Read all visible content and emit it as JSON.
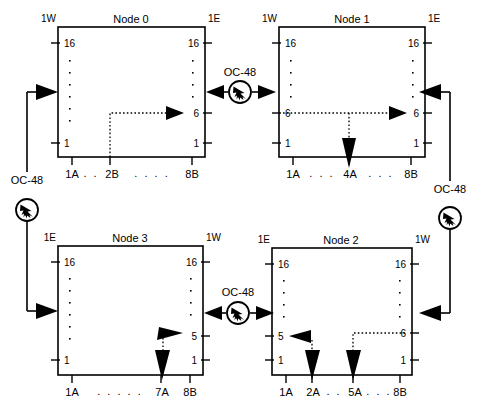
{
  "diagram": {
    "link_label": "OC-48",
    "colors": {
      "line": "#000000",
      "background": "#ffffff"
    },
    "nodes": [
      {
        "id": "node0",
        "title": "Node 0",
        "left_side_label": "1W",
        "right_side_label": "1E",
        "left_port_top": "16",
        "left_port_bottom": "1",
        "right_port_top": "16",
        "right_port_bottom": "1",
        "right_port_mid": "6",
        "slot_labels": [
          "1A",
          "2B",
          "8B"
        ],
        "slot_dots_left": ". .",
        "slot_dots_right": ". . . .",
        "paths": [
          {
            "from": "2B",
            "to": "right port 6",
            "style": "dotted",
            "arrow": "right"
          }
        ]
      },
      {
        "id": "node1",
        "title": "Node 1",
        "left_side_label": "1W",
        "right_side_label": "1E",
        "left_port_top": "16",
        "left_port_bottom": "1",
        "left_port_mid": "6",
        "right_port_top": "16",
        "right_port_bottom": "1",
        "right_port_mid": "6",
        "slot_labels": [
          "1A",
          "4A",
          "8B"
        ],
        "slot_dots_left": ". . .",
        "slot_dots_right": ". . .",
        "paths": [
          {
            "from": "left port 6",
            "to": "right port 6",
            "style": "dotted",
            "arrow": "right"
          },
          {
            "from": "left port 6",
            "to": "4A",
            "style": "dotted",
            "arrow": "down"
          }
        ]
      },
      {
        "id": "node2",
        "title": "Node 2",
        "left_side_label": "1E",
        "right_side_label": "1W",
        "left_port_top": "16",
        "left_port_bottom": "1",
        "left_port_mid": "5",
        "right_port_top": "16",
        "right_port_bottom": "1",
        "right_port_mid": "6",
        "slot_labels": [
          "1A",
          "2A",
          "5A",
          "8B"
        ],
        "slot_dots_mid": ". .",
        "slot_dots_right": ". . .",
        "paths": [
          {
            "from": "left port 5",
            "to": "2A",
            "style": "dotted",
            "arrow": "down-and-left"
          },
          {
            "from": "right port 6",
            "to": "5A",
            "style": "dotted",
            "arrow": "down"
          }
        ]
      },
      {
        "id": "node3",
        "title": "Node 3",
        "left_side_label": "1E",
        "right_side_label": "1W",
        "left_port_top": "16",
        "left_port_bottom": "1",
        "right_port_top": "16",
        "right_port_bottom": "1",
        "right_port_mid": "5",
        "slot_labels": [
          "1A",
          "7A",
          "8B"
        ],
        "slot_dots_mid": ". . . . .",
        "paths": [
          {
            "from": "right port 5",
            "to": "7A",
            "style": "dotted",
            "arrow": "down"
          }
        ]
      }
    ],
    "links": [
      {
        "id": "link-top",
        "label": "OC-48",
        "between": [
          "node0 1E",
          "node1 1W"
        ],
        "icon": "oc48-amplifier-icon"
      },
      {
        "id": "link-left",
        "label": "OC-48",
        "between": [
          "node3 1E",
          "node0 1W"
        ],
        "icon": "oc48-amplifier-icon"
      },
      {
        "id": "link-right",
        "label": "OC-48",
        "between": [
          "node1 1E",
          "node2 1W"
        ],
        "icon": "oc48-amplifier-icon"
      },
      {
        "id": "link-bottom",
        "label": "OC-48",
        "between": [
          "node2 1E",
          "node3 1W"
        ],
        "icon": "oc48-amplifier-icon"
      }
    ]
  }
}
